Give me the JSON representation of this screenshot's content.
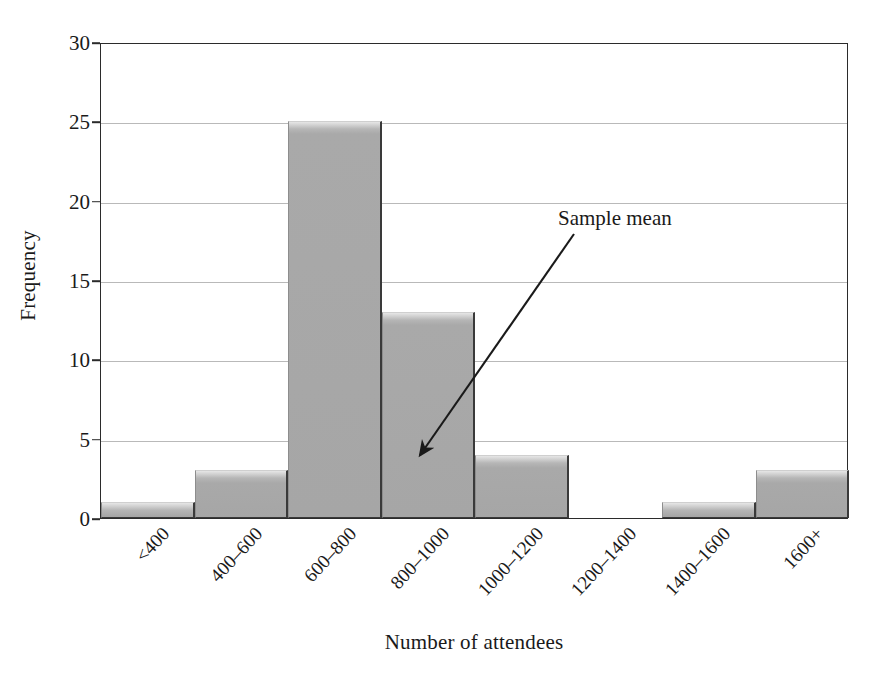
{
  "chart_data": {
    "type": "bar",
    "title": "",
    "xlabel": "Number of attendees",
    "ylabel": "Frequency",
    "categories": [
      "<400",
      "400–600",
      "600–800",
      "800–1000",
      "1000–1200",
      "1200–1400",
      "1400–1600",
      "1600+"
    ],
    "values": [
      1,
      3,
      25,
      13,
      4,
      0,
      1,
      3
    ],
    "ylim": [
      0,
      30
    ],
    "yticks": [
      0,
      5,
      10,
      15,
      20,
      25,
      30
    ],
    "ytick_labels": [
      "0",
      "5",
      "10",
      "15",
      "20",
      "25",
      "30"
    ],
    "grid": "horizontal",
    "legend": "none",
    "annotations": [
      {
        "text": "Sample mean",
        "target_category": "800–1000",
        "target_value": 4.0
      }
    ],
    "colors": {
      "bar_fill": "#a6a6a6",
      "bar_highlight": "#e6e6e6",
      "bar_edge": "#3a3a3a",
      "gridline": "#b9b9b9",
      "axis": "#2b2b2b",
      "text": "#1a1a1a",
      "background": "#ffffff"
    }
  }
}
